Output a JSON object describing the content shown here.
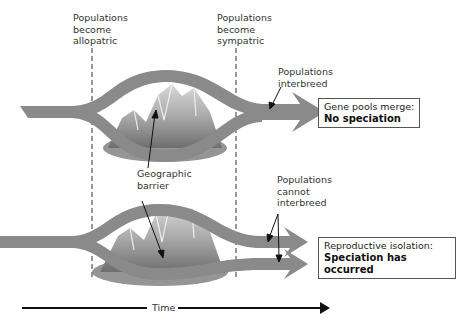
{
  "labels": {
    "allopatric": [
      "Populations",
      "become",
      "allopatric"
    ],
    "sympatric": [
      "Populations",
      "become",
      "sympatric"
    ],
    "interbreed": [
      "Populations",
      "interbreed"
    ],
    "barrier": [
      "Geographic",
      "barrier"
    ],
    "cannot_interbreed": [
      "Populations",
      "cannot",
      "interbreed"
    ]
  },
  "outcomes": {
    "top": {
      "line1": "Gene pools merge:",
      "line2": "No speciation"
    },
    "bottom": {
      "line1": "Reproductive isolation:",
      "line2": "Speciation has occurred"
    }
  },
  "axis": {
    "label": "Time"
  },
  "colors": {
    "band": "#8a8a8a",
    "mountain": "#b4b4b4",
    "line": "#222222"
  }
}
